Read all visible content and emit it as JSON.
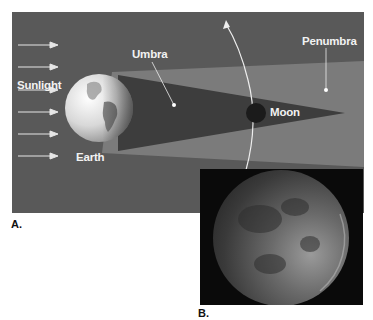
{
  "figure": {
    "panel_a": {
      "label": "A.",
      "labels": {
        "sunlight": "Sunlight",
        "earth": "Earth",
        "umbra": "Umbra",
        "penumbra": "Penumbra",
        "moon": "Moon"
      },
      "colors": {
        "background": "#5a5a5a",
        "penumbra": "#7a7a7a",
        "umbra": "#3c3c3c",
        "moon": "#1a1a1a",
        "text": "#f2f2f2"
      },
      "sunlight_arrow_count": 6
    },
    "panel_b": {
      "label": "B.",
      "description": "Photograph of the Moon during a lunar eclipse",
      "colors": {
        "background": "#0a0a0a",
        "moon_light": "#9a9a9a",
        "moon_dark": "#3a3a3a"
      }
    }
  }
}
